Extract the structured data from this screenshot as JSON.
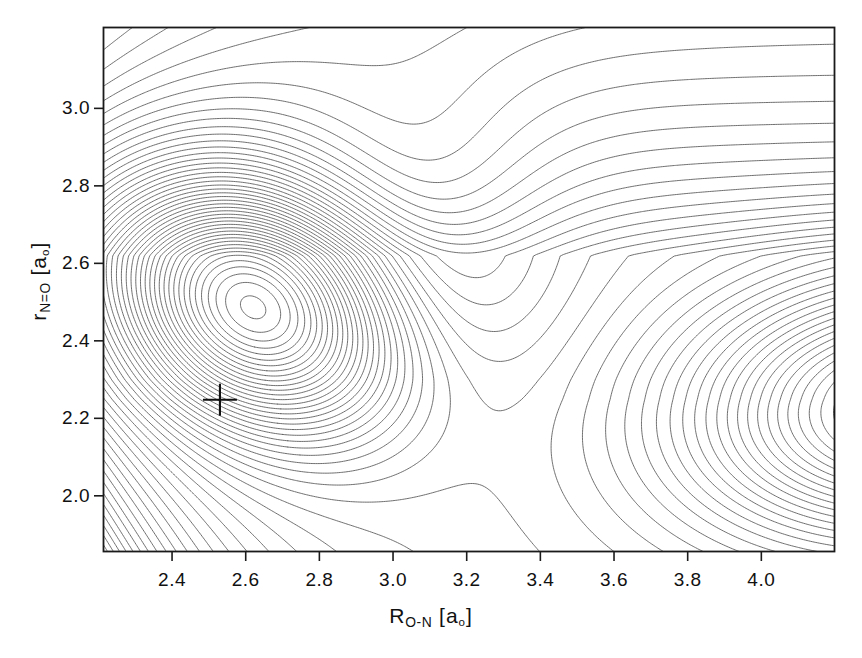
{
  "figure": {
    "kind": "contour-plot",
    "background_color": "#ffffff",
    "frame_color": "#1a1a1a",
    "contour_color": "#555555"
  },
  "axes": {
    "x": {
      "title_main": "R",
      "title_sub": "O-N",
      "title_unit_open": "[a",
      "title_unit_sub": "o",
      "title_unit_close": "]",
      "title_plain": "R_O-N [a_o]",
      "min": 2.2125,
      "max": 4.2,
      "ticks": [
        2.4,
        2.6,
        2.8,
        3.0,
        3.2,
        3.4,
        3.6,
        3.8,
        4.0
      ],
      "tick_labels": [
        "2.4",
        "2.6",
        "2.8",
        "3.0",
        "3.2",
        "3.4",
        "3.6",
        "3.8",
        "4.0"
      ]
    },
    "y": {
      "title_main": "r",
      "title_sub": "N=O",
      "title_unit_open": "[a",
      "title_unit_sub": "o",
      "title_unit_close": "]",
      "title_plain": "r_N=O [a_o]",
      "min": 1.855,
      "max": 3.21,
      "ticks": [
        2.0,
        2.2,
        2.4,
        2.6,
        2.8,
        3.0
      ],
      "tick_labels": [
        "2.0",
        "2.2",
        "2.4",
        "2.6",
        "2.8",
        "3.0"
      ]
    }
  },
  "plot_area_px": {
    "left": 103,
    "top": 27,
    "right": 835,
    "bottom": 552
  },
  "marker": {
    "name": "cross-marker",
    "x": 2.53,
    "y": 2.248,
    "half_width_px": 17,
    "half_height_px": 16,
    "color": "#111111"
  },
  "chart_data": {
    "type": "contour",
    "title": "",
    "xlabel": "R_O-N [a_o]",
    "ylabel": "r_N=O [a_o]",
    "xlim": [
      2.2125,
      4.2
    ],
    "ylim": [
      1.855,
      3.21
    ],
    "grid": false,
    "legend": "none",
    "contour_color": "#555555",
    "level_spacing": 1.0,
    "levels": [
      1,
      2,
      3,
      4,
      5,
      6,
      7,
      8,
      9,
      10,
      11,
      12,
      13,
      14,
      15,
      16,
      17,
      18,
      19,
      20,
      21,
      22,
      23,
      24,
      25,
      26,
      27,
      28,
      29,
      30,
      31,
      32,
      33,
      34,
      35,
      36,
      37,
      38,
      39,
      40,
      41,
      42,
      43,
      44,
      45,
      46,
      47,
      48,
      49,
      50
    ],
    "features": [
      {
        "name": "primary-minimum-well",
        "description": "deep closed-contour well, innermost loop is an elongated oval",
        "x": 2.63,
        "y": 2.49,
        "innermost_loop_px": {
          "x0": 205,
          "y0": 235,
          "x1": 315,
          "y1": 330
        }
      },
      {
        "name": "saddle-point",
        "description": "pass connecting primary well to right-hand valley",
        "x": 3.02,
        "y": 2.32
      },
      {
        "name": "secondary-valley",
        "description": "second minimum opening toward the right edge of the frame",
        "x": 4.25,
        "y": 2.24
      },
      {
        "name": "repulsive-wall-lower-left",
        "description": "dense bundle of steeply rising contours sweeping from upper-left to lower-right"
      },
      {
        "name": "dissociation-plateau-upper-right",
        "description": "near-horizontal contours flattening toward the upper-right corner"
      }
    ],
    "model": {
      "note": "analytic surface reproducing the drawn contour topology",
      "wellA": {
        "x": 2.63,
        "y": 2.49,
        "depth": 30.5,
        "sx": 0.4,
        "sy": 0.285,
        "rot": -0.42
      },
      "wellB": {
        "x": 4.42,
        "y": 2.23,
        "depth": 26.5,
        "sx": 0.6,
        "sy": 0.33,
        "rot": 0.06
      },
      "barrier": {
        "x": 3.05,
        "y": 2.62,
        "height": 7.0,
        "sx": 0.36,
        "sy": 0.4
      },
      "wall": {
        "a": 1.3,
        "b": 0.8,
        "x0": 2.05,
        "y0": 1.72,
        "k": 2.55
      },
      "plateau": {
        "level": 30.0
      }
    }
  }
}
